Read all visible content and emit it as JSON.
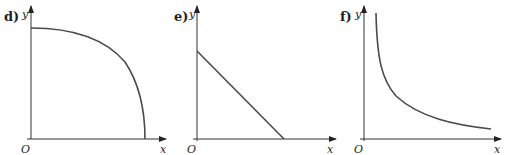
{
  "graphs": [
    {
      "label": "d)",
      "y_label": "y",
      "x_label": "x",
      "origin_label": "O",
      "shape": "quarter-ellipse arc decreasing from y-intercept to x-intercept (concave down)"
    },
    {
      "label": "e)",
      "y_label": "y",
      "x_label": "x",
      "origin_label": "O",
      "shape": "straight line with negative slope from y-intercept to x-intercept"
    },
    {
      "label": "f)",
      "y_label": "y",
      "x_label": "x",
      "origin_label": "O",
      "shape": "reciprocal-type curve decreasing, asymptotic to both axes"
    }
  ],
  "colors": {
    "axis": "#333333",
    "curve": "#4a4a4a",
    "text": "#231f20"
  }
}
